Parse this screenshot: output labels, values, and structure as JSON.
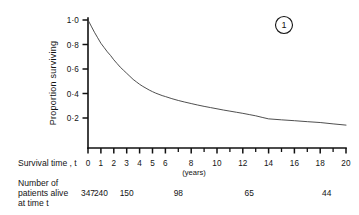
{
  "figure": {
    "badge_label": "1",
    "badge_name": "figure-number-circle"
  },
  "chart_data": {
    "type": "line",
    "title": "",
    "subtitle": "",
    "xlabel": "Survival time , t",
    "xunits": "(years)",
    "ylabel": "Proportion surviving",
    "xlim": [
      0,
      20
    ],
    "ylim": [
      0,
      1.0
    ],
    "grid": false,
    "legend": null,
    "x_tick_labels": [
      "0",
      "1",
      "2",
      "3",
      "4",
      "5",
      "6",
      "8",
      "10",
      "12",
      "14",
      "16",
      "18",
      "20"
    ],
    "x_tick_values": [
      0,
      1,
      2,
      3,
      4,
      5,
      6,
      8,
      10,
      12,
      14,
      16,
      18,
      20
    ],
    "x_minor_tick_values": [
      7,
      9,
      11,
      13,
      15,
      17,
      19
    ],
    "y_tick_labels": [
      "1·0",
      "0·8",
      "0·6",
      "0·4",
      "0·2"
    ],
    "y_tick_values": [
      1.0,
      0.8,
      0.6,
      0.4,
      0.2
    ],
    "series": [
      {
        "name": "Proportion surviving",
        "x": [
          0.0,
          0.25,
          0.5,
          0.75,
          1.0,
          1.25,
          1.5,
          1.75,
          2.0,
          2.25,
          2.5,
          2.75,
          3.0,
          3.25,
          3.5,
          3.75,
          4.0,
          4.25,
          4.5,
          4.75,
          5.0,
          5.25,
          5.5,
          5.75,
          6.0,
          6.5,
          7.0,
          7.5,
          8.0,
          8.5,
          9.0,
          9.5,
          10.0,
          10.5,
          11.0,
          11.5,
          12.0,
          12.5,
          13.0,
          13.5,
          14.0,
          15.0,
          16.0,
          17.0,
          18.0,
          19.0,
          20.0
        ],
        "y": [
          1.0,
          0.95,
          0.9,
          0.855,
          0.81,
          0.775,
          0.74,
          0.71,
          0.675,
          0.645,
          0.615,
          0.59,
          0.565,
          0.54,
          0.515,
          0.495,
          0.475,
          0.458,
          0.443,
          0.428,
          0.415,
          0.403,
          0.393,
          0.383,
          0.375,
          0.358,
          0.343,
          0.33,
          0.318,
          0.306,
          0.295,
          0.285,
          0.275,
          0.265,
          0.256,
          0.247,
          0.238,
          0.228,
          0.218,
          0.205,
          0.193,
          0.185,
          0.178,
          0.17,
          0.163,
          0.152,
          0.142
        ]
      }
    ],
    "risk_table": {
      "caption_lines": [
        "Number of",
        "patients alive",
        "at time t"
      ],
      "times": [
        0,
        1,
        3,
        7,
        12.5,
        18.5
      ],
      "counts": [
        "347",
        "240",
        "150",
        "98",
        "65",
        "44"
      ]
    }
  }
}
